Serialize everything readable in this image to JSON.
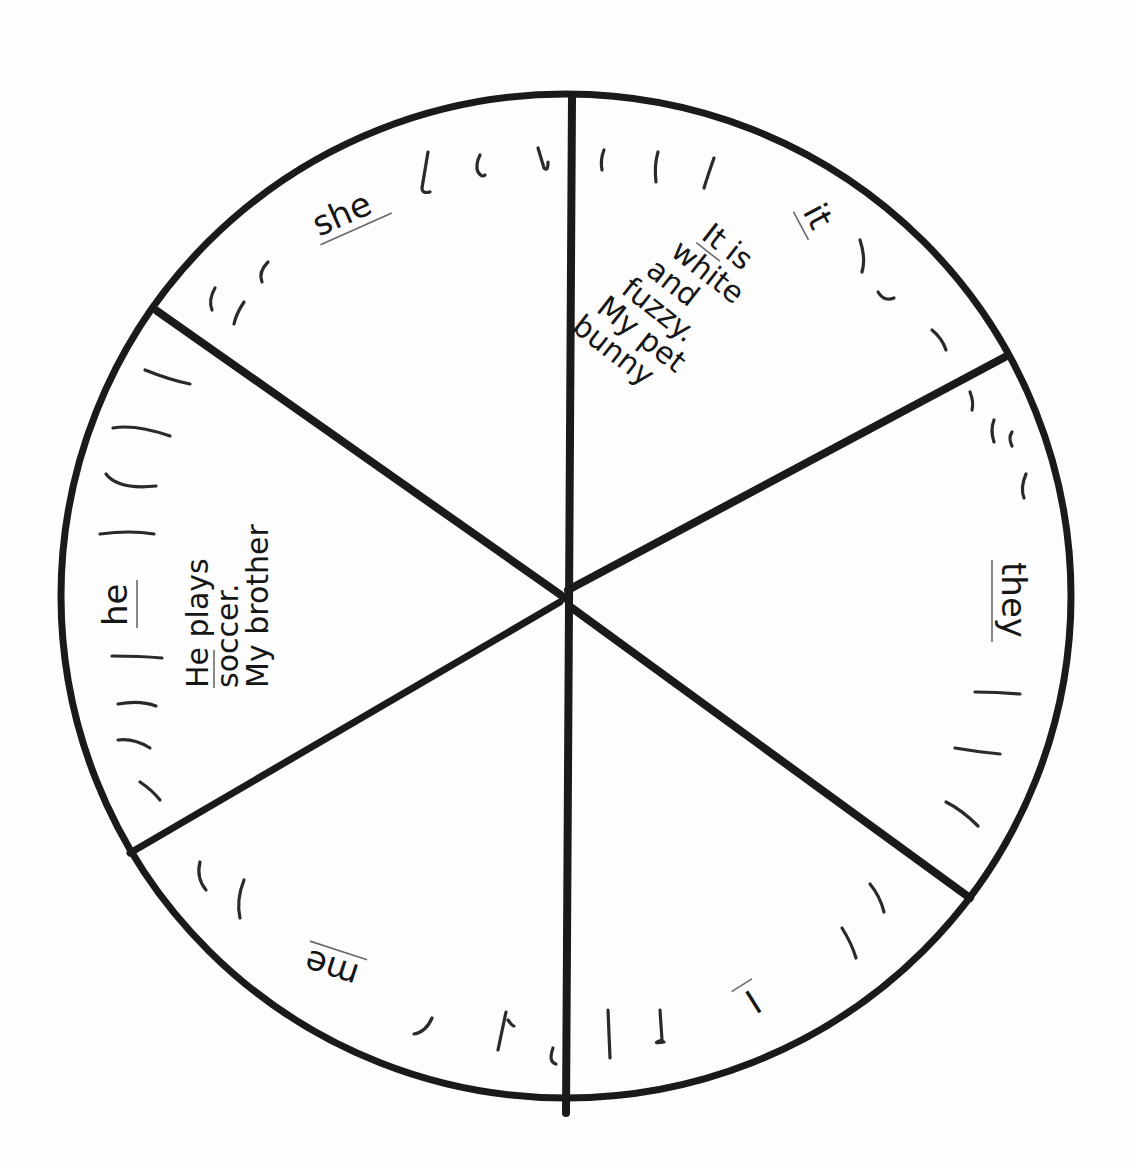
{
  "worksheet": {
    "type": "pronoun-wheel",
    "wheel": {
      "center": [
        567,
        598
      ],
      "radius": 505,
      "segments": [
        {
          "pronoun": "she",
          "underlined": true,
          "sentence_lines": []
        },
        {
          "pronoun": "it",
          "underlined": true,
          "sentence_lines": [
            "It is",
            "white",
            "and",
            "fuzzy.",
            "My pet",
            "bunny"
          ],
          "sentence_underlined_word": "It"
        },
        {
          "pronoun": "they",
          "underlined": true,
          "sentence_lines": []
        },
        {
          "pronoun": "I",
          "underlined": true,
          "sentence_lines": []
        },
        {
          "pronoun": "me",
          "underlined": true,
          "sentence_lines": []
        },
        {
          "pronoun": "he",
          "underlined": true,
          "sentence_lines": [
            "He plays",
            "soccer.",
            "My brother"
          ],
          "sentence_underlined_word": "He"
        }
      ]
    },
    "labels": {
      "she": "she",
      "it": "it",
      "they": "they",
      "I": "I",
      "me": "me",
      "he": "he"
    },
    "sentences": {
      "it": {
        "line1_underlined": "It",
        "line1_rest": " is",
        "line2": "white",
        "line3": "and",
        "line4": "fuzzy.",
        "line5": "My pet",
        "line6": "bunny"
      },
      "he": {
        "line1_underlined": "He",
        "line1_rest": " plays",
        "line2": "soccer.",
        "line3": "My brother"
      }
    },
    "colors": {
      "ink": "#1a1a1a",
      "paper": "#fdfdfd",
      "underline": "#6a6a6a"
    }
  }
}
